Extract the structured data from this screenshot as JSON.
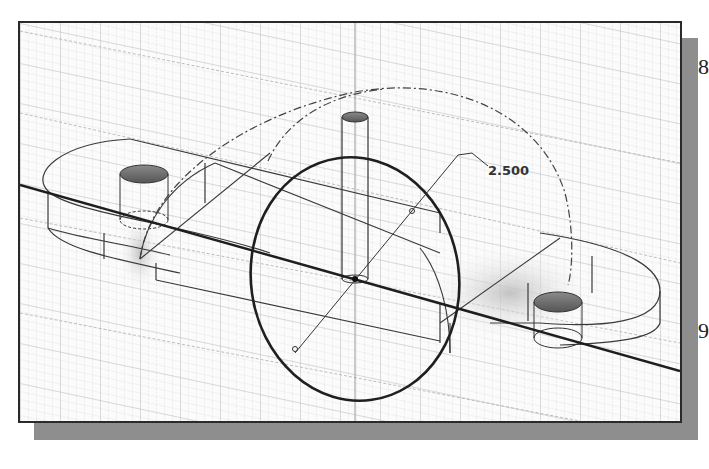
{
  "viewport": {
    "type": "3D sketch viewport",
    "grid": "on",
    "background": "#fbfbfb",
    "frame_color": "#2a2a2a",
    "shadow_color": "#8e8e8e"
  },
  "dimension": {
    "value": "2.500",
    "type": "diameter"
  },
  "model": {
    "description": "Isometric wireframe part with slotted base, two holes, vertical pin, half-arc and circle sketch"
  },
  "page_edge": {
    "char_top": "8",
    "char_bottom": "9"
  }
}
